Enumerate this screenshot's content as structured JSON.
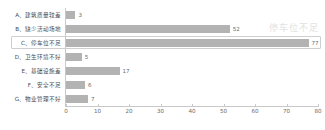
{
  "watermark": {
    "text": "停车位不足"
  },
  "chart_data": {
    "type": "bar",
    "orientation": "horizontal",
    "title": "",
    "xlabel": "",
    "ylabel": "",
    "xlim": [
      0,
      80
    ],
    "grid": false,
    "legend": false,
    "bar_color": "#b3b3b3",
    "highlight_index": 2,
    "categories": [
      "A、建筑质量较差",
      "B、缺少活动场地",
      "C、停车位不足",
      "D、卫生环境不好",
      "E、基础设施差",
      "F、安全不足",
      "G、物业管理不好"
    ],
    "values": [
      3,
      52,
      77,
      5,
      17,
      6,
      7
    ],
    "value_labels": [
      "3",
      "52",
      "77",
      "5",
      "17",
      "6",
      "7"
    ],
    "xticks": [
      0,
      10,
      20,
      30,
      40,
      50,
      60,
      70,
      80
    ],
    "xticklabels": [
      "0",
      "10",
      "20",
      "30",
      "40",
      "50",
      "60",
      "70",
      "80"
    ]
  }
}
